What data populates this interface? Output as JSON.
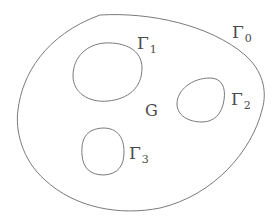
{
  "diagram": {
    "region_label": "G",
    "boundaries": [
      {
        "id": "gamma0",
        "symbol": "Γ",
        "subscript": "0",
        "role": "outer boundary"
      },
      {
        "id": "gamma1",
        "symbol": "Γ",
        "subscript": "1",
        "role": "inner boundary"
      },
      {
        "id": "gamma2",
        "symbol": "Γ",
        "subscript": "2",
        "role": "inner boundary"
      },
      {
        "id": "gamma3",
        "symbol": "Γ",
        "subscript": "3",
        "role": "inner boundary"
      }
    ],
    "colors": {
      "stroke": "#7a7a7a",
      "text": "#4a4a4a",
      "background": "#ffffff"
    }
  }
}
